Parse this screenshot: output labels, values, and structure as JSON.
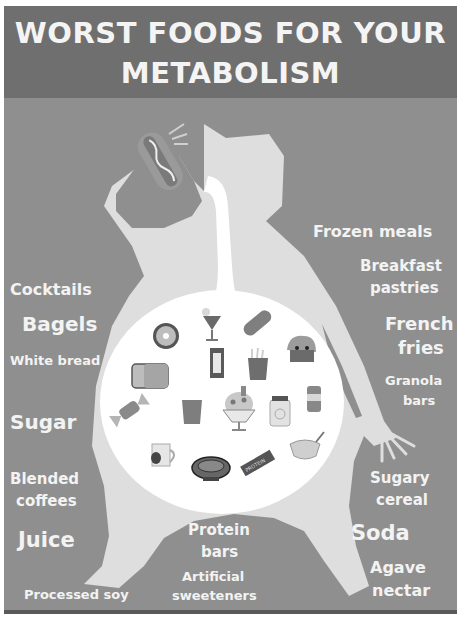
{
  "title": {
    "line1": "WORST FOODS FOR YOUR",
    "line2": "METABOLISM"
  },
  "colors": {
    "header_bg": "#6f6f6f",
    "poster_bg": "#8f8f8f",
    "figure": "#dedede",
    "belly": "#ffffff",
    "text": "#f3f3f3"
  },
  "labels_left": [
    {
      "text": "Cocktails"
    },
    {
      "text": "Bagels"
    },
    {
      "text": "White bread"
    },
    {
      "text": "Sugar"
    },
    {
      "text": "Blended"
    },
    {
      "text": "coffees"
    },
    {
      "text": "Juice"
    },
    {
      "text": "Processed soy"
    }
  ],
  "labels_right": [
    {
      "text": "Frozen meals"
    },
    {
      "text": "Breakfast"
    },
    {
      "text": "pastries"
    },
    {
      "text": "French"
    },
    {
      "text": "fries"
    },
    {
      "text": "Granola"
    },
    {
      "text": "bars"
    },
    {
      "text": "Sugary"
    },
    {
      "text": "cereal"
    },
    {
      "text": "Soda"
    },
    {
      "text": "Agave"
    },
    {
      "text": "nectar"
    }
  ],
  "labels_center": [
    {
      "text": "Protein"
    },
    {
      "text": "bars"
    },
    {
      "text": "Artificial"
    },
    {
      "text": "sweeteners"
    }
  ],
  "food_icons": [
    "hot-dog-icon",
    "donut-icon",
    "cocktail-icon",
    "baguette-icon",
    "cupcake-icon",
    "bread-loaf-icon",
    "candy-bar-icon",
    "french-fries-icon",
    "candy-icon",
    "juice-glass-icon",
    "sundae-icon",
    "jar-icon",
    "soda-can-icon",
    "coffee-mug-icon",
    "soy-bowl-icon",
    "protein-bar-icon",
    "cereal-bowl-icon"
  ],
  "protein_bar_text": "PROTEIN"
}
